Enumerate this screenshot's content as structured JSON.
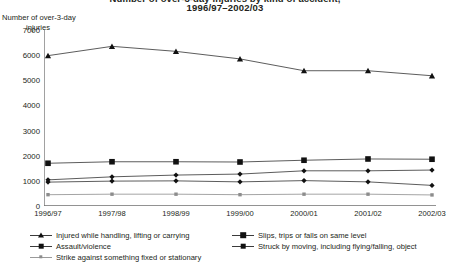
{
  "header": {
    "title_line1": "Number of over-3-day injuries by kind of accident,",
    "title_line2": "1996/97–2002/03"
  },
  "axis": {
    "y_title_line1": "Number of over-3-day",
    "y_title_line2": "injuries",
    "y_ticks": [
      "0",
      "1000",
      "2000",
      "3000",
      "4000",
      "5000",
      "6000",
      "7000"
    ],
    "x_ticks": [
      "1996/97",
      "1997/98",
      "1998/99",
      "1999/00",
      "2000/01",
      "2001/02",
      "2002/03"
    ]
  },
  "legend": {
    "items": [
      {
        "label": "Injured while handling, lifting or carrying",
        "marker": "triangle",
        "color": "#111111"
      },
      {
        "label": "Assault/violence",
        "marker": "diamond",
        "color": "#111111"
      },
      {
        "label": "Strike against something fixed or stationary",
        "marker": "small-square",
        "color": "#8c8c8c"
      },
      {
        "label": "Slips, trips or falls on same level",
        "marker": "square",
        "color": "#111111"
      },
      {
        "label": "Struck by moving, including flying/falling, object",
        "marker": "diamond",
        "color": "#111111"
      }
    ]
  },
  "chart_data": {
    "type": "line",
    "title": "Number of over-3-day injuries by kind of accident, 1996/97–2002/03",
    "xlabel": "",
    "ylabel": "Number of over-3-day injuries",
    "x": [
      "1996/97",
      "1997/98",
      "1998/99",
      "1999/00",
      "2000/01",
      "2001/02",
      "2002/03"
    ],
    "ylim": [
      0,
      7000
    ],
    "ytick_step": 1000,
    "grid": false,
    "legend_position": "bottom",
    "series": [
      {
        "name": "Injured while handling, lifting or carrying",
        "marker": "triangle",
        "color": "#111111",
        "values": [
          5980,
          6350,
          6150,
          5850,
          5380,
          5380,
          5180
        ]
      },
      {
        "name": "Slips, trips or falls on same level",
        "marker": "square",
        "color": "#111111",
        "values": [
          1700,
          1760,
          1760,
          1750,
          1820,
          1870,
          1860
        ]
      },
      {
        "name": "Struck by moving, including flying/falling, object",
        "marker": "diamond",
        "color": "#111111",
        "values": [
          1040,
          1160,
          1230,
          1270,
          1400,
          1400,
          1430
        ]
      },
      {
        "name": "Assault/violence",
        "marker": "diamond",
        "color": "#111111",
        "values": [
          950,
          990,
          1000,
          960,
          1010,
          960,
          820
        ]
      },
      {
        "name": "Strike against something fixed or stationary",
        "marker": "small-square",
        "color": "#8c8c8c",
        "values": [
          450,
          470,
          470,
          450,
          470,
          470,
          440
        ]
      }
    ]
  }
}
